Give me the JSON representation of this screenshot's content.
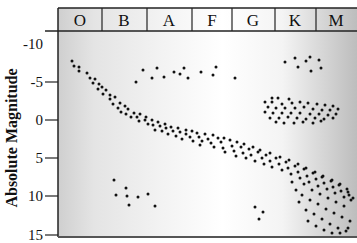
{
  "chart_data": {
    "type": "scatter",
    "title": "",
    "xlabel": "Spectral Class",
    "ylabel": "Absolute Magnitude",
    "categories": [
      "O",
      "B",
      "A",
      "F",
      "G",
      "K",
      "M"
    ],
    "y_ticks": [
      "-10",
      "-5",
      "0",
      "5",
      "10",
      "15"
    ],
    "y_tick_values": [
      -10,
      -5,
      0,
      5,
      10,
      15
    ],
    "ylim": [
      -10,
      15
    ],
    "y_inverted": true,
    "grid": false,
    "legend": "none",
    "background_gradient": [
      "#d8d8d8",
      "#f6f6f6",
      "#ffffff",
      "#c8c8c8"
    ],
    "series": [
      {
        "name": "Main Sequence",
        "description": "diagonal band from upper-left (O, mag ~-8) to lower-right (M, mag ~15)",
        "points_px": [
          [
            72,
            61
          ],
          [
            74,
            66
          ],
          [
            79,
            67
          ],
          [
            79,
            71
          ],
          [
            87,
            73
          ],
          [
            90,
            78
          ],
          [
            95,
            79
          ],
          [
            93,
            83
          ],
          [
            99,
            84
          ],
          [
            102,
            87
          ],
          [
            98,
            89
          ],
          [
            106,
            90
          ],
          [
            103,
            94
          ],
          [
            110,
            95
          ],
          [
            110,
            99
          ],
          [
            115,
            97
          ],
          [
            113,
            104
          ],
          [
            120,
            103
          ],
          [
            118,
            108
          ],
          [
            125,
            106
          ],
          [
            121,
            112
          ],
          [
            128,
            109
          ],
          [
            126,
            114
          ],
          [
            134,
            113
          ],
          [
            131,
            117
          ],
          [
            137,
            117
          ],
          [
            140,
            114
          ],
          [
            139,
            121
          ],
          [
            145,
            120
          ],
          [
            146,
            117
          ],
          [
            148,
            124
          ],
          [
            152,
            120
          ],
          [
            153,
            125
          ],
          [
            155,
            130
          ],
          [
            158,
            122
          ],
          [
            160,
            126
          ],
          [
            162,
            131
          ],
          [
            165,
            124
          ],
          [
            166,
            128
          ],
          [
            168,
            134
          ],
          [
            171,
            127
          ],
          [
            173,
            131
          ],
          [
            176,
            136
          ],
          [
            178,
            128
          ],
          [
            180,
            132
          ],
          [
            182,
            139
          ],
          [
            186,
            130
          ],
          [
            186,
            134
          ],
          [
            190,
            137
          ],
          [
            193,
            141
          ],
          [
            192,
            131
          ],
          [
            197,
            133
          ],
          [
            199,
            137
          ],
          [
            202,
            141
          ],
          [
            200,
            145
          ],
          [
            205,
            134
          ],
          [
            208,
            139
          ],
          [
            211,
            143
          ],
          [
            214,
            147
          ],
          [
            213,
            135
          ],
          [
            218,
            138
          ],
          [
            221,
            142
          ],
          [
            223,
            148
          ],
          [
            225,
            152
          ],
          [
            224,
            138
          ],
          [
            230,
            140
          ],
          [
            232,
            146
          ],
          [
            234,
            151
          ],
          [
            236,
            156
          ],
          [
            237,
            142
          ],
          [
            241,
            147
          ],
          [
            243,
            153
          ],
          [
            246,
            158
          ],
          [
            244,
            144
          ],
          [
            249,
            149
          ],
          [
            251,
            155
          ],
          [
            255,
            161
          ],
          [
            253,
            147
          ],
          [
            258,
            152
          ],
          [
            262,
            158
          ],
          [
            264,
            164
          ],
          [
            260,
            150
          ],
          [
            266,
            155
          ],
          [
            270,
            161
          ],
          [
            272,
            167
          ],
          [
            270,
            153
          ],
          [
            276,
            158
          ],
          [
            279,
            164
          ],
          [
            282,
            170
          ],
          [
            280,
            157
          ],
          [
            286,
            162
          ],
          [
            288,
            168
          ],
          [
            291,
            174
          ],
          [
            289,
            160
          ],
          [
            295,
            166
          ],
          [
            298,
            172
          ],
          [
            300,
            178
          ],
          [
            298,
            164
          ],
          [
            304,
            169
          ],
          [
            307,
            176
          ],
          [
            309,
            182
          ],
          [
            306,
            168
          ],
          [
            313,
            173
          ],
          [
            316,
            179
          ],
          [
            318,
            186
          ],
          [
            315,
            172
          ],
          [
            322,
            177
          ],
          [
            324,
            183
          ],
          [
            327,
            189
          ],
          [
            323,
            176
          ],
          [
            331,
            181
          ],
          [
            333,
            187
          ],
          [
            335,
            193
          ],
          [
            332,
            180
          ],
          [
            339,
            185
          ],
          [
            341,
            191
          ],
          [
            344,
            197
          ],
          [
            340,
            184
          ],
          [
            347,
            189
          ],
          [
            349,
            195
          ],
          [
            351,
            200
          ],
          [
            348,
            192
          ],
          [
            353,
            198
          ],
          [
            304,
            184
          ],
          [
            312,
            190
          ],
          [
            320,
            194
          ],
          [
            328,
            198
          ],
          [
            336,
            202
          ],
          [
            344,
            206
          ],
          [
            302,
            195
          ],
          [
            310,
            200
          ],
          [
            318,
            204
          ],
          [
            326,
            209
          ],
          [
            334,
            213
          ],
          [
            342,
            217
          ],
          [
            350,
            221
          ],
          [
            306,
            210
          ],
          [
            314,
            214
          ],
          [
            322,
            219
          ],
          [
            330,
            224
          ],
          [
            338,
            228
          ],
          [
            346,
            231
          ],
          [
            308,
            221
          ],
          [
            316,
            226
          ],
          [
            324,
            230
          ],
          [
            332,
            233
          ],
          [
            340,
            233
          ],
          [
            348,
            228
          ],
          [
            299,
            202
          ],
          [
            296,
            190
          ],
          [
            292,
            182
          ]
        ]
      },
      {
        "name": "Giants",
        "description": "cluster in K-M region around magnitude 0",
        "points_px": [
          [
            272,
            98
          ],
          [
            278,
            98
          ],
          [
            289,
            99
          ],
          [
            265,
            102
          ],
          [
            272,
            102
          ],
          [
            282,
            104
          ],
          [
            292,
            103
          ],
          [
            300,
            102
          ],
          [
            308,
            103
          ],
          [
            317,
            104
          ],
          [
            325,
            105
          ],
          [
            333,
            106
          ],
          [
            268,
            107
          ],
          [
            276,
            108
          ],
          [
            285,
            108
          ],
          [
            295,
            108
          ],
          [
            304,
            107
          ],
          [
            313,
            109
          ],
          [
            322,
            110
          ],
          [
            330,
            110
          ],
          [
            338,
            109
          ],
          [
            265,
            112
          ],
          [
            273,
            113
          ],
          [
            282,
            113
          ],
          [
            291,
            113
          ],
          [
            300,
            113
          ],
          [
            310,
            114
          ],
          [
            319,
            114
          ],
          [
            328,
            115
          ],
          [
            336,
            114
          ],
          [
            270,
            118
          ],
          [
            279,
            118
          ],
          [
            288,
            117
          ],
          [
            297,
            118
          ],
          [
            306,
            119
          ],
          [
            315,
            118
          ],
          [
            324,
            119
          ],
          [
            333,
            118
          ],
          [
            276,
            122
          ],
          [
            284,
            123
          ],
          [
            294,
            123
          ],
          [
            303,
            122
          ],
          [
            313,
            123
          ],
          [
            321,
            121
          ]
        ]
      },
      {
        "name": "Supergiants",
        "description": "scattered stars across B to M near magnitude -7 to -5",
        "points_px": [
          [
            136,
            82
          ],
          [
            143,
            70
          ],
          [
            152,
            78
          ],
          [
            157,
            68
          ],
          [
            164,
            77
          ],
          [
            174,
            72
          ],
          [
            180,
            74
          ],
          [
            184,
            68
          ],
          [
            188,
            78
          ],
          [
            201,
            72
          ],
          [
            216,
            67
          ],
          [
            213,
            75
          ],
          [
            235,
            78
          ],
          [
            285,
            62
          ],
          [
            295,
            58
          ],
          [
            298,
            67
          ],
          [
            306,
            61
          ],
          [
            310,
            57
          ],
          [
            311,
            71
          ],
          [
            319,
            60
          ],
          [
            321,
            68
          ]
        ]
      },
      {
        "name": "White Dwarfs",
        "description": "scatter in B-A region around magnitude 8-11, plus a few near G",
        "points_px": [
          [
            114,
            180
          ],
          [
            116,
            195
          ],
          [
            126,
            188
          ],
          [
            127,
            196
          ],
          [
            138,
            197
          ],
          [
            129,
            205
          ],
          [
            148,
            194
          ],
          [
            155,
            206
          ],
          [
            255,
            207
          ],
          [
            263,
            212
          ],
          [
            259,
            219
          ]
        ]
      }
    ]
  }
}
